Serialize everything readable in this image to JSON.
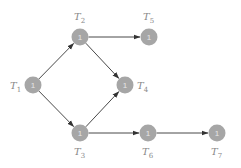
{
  "diagram": {
    "type": "task-dependency-graph",
    "colors": {
      "node_fill": "#a6a6a6",
      "node_text": "#e6e6e6",
      "edge": "#333333",
      "label": "#888888"
    },
    "nodes": [
      {
        "id": "T1",
        "name": "T",
        "sub": "1",
        "value": "1",
        "cx": 33,
        "cy": 85,
        "lx": 10,
        "ly": 89
      },
      {
        "id": "T2",
        "name": "T",
        "sub": "2",
        "value": "1",
        "cx": 80,
        "cy": 37,
        "lx": 74,
        "ly": 20
      },
      {
        "id": "T3",
        "name": "T",
        "sub": "3",
        "value": "1",
        "cx": 80,
        "cy": 133,
        "lx": 74,
        "ly": 155
      },
      {
        "id": "T4",
        "name": "T",
        "sub": "4",
        "value": "1",
        "cx": 125,
        "cy": 85,
        "lx": 137,
        "ly": 89
      },
      {
        "id": "T5",
        "name": "T",
        "sub": "5",
        "value": "1",
        "cx": 149,
        "cy": 37,
        "lx": 143,
        "ly": 20
      },
      {
        "id": "T6",
        "name": "T",
        "sub": "6",
        "value": "1",
        "cx": 148,
        "cy": 133,
        "lx": 142,
        "ly": 155
      },
      {
        "id": "T7",
        "name": "T",
        "sub": "7",
        "value": "1",
        "cx": 217,
        "cy": 133,
        "lx": 211,
        "ly": 155
      }
    ],
    "edges": [
      {
        "from": "T1",
        "to": "T2"
      },
      {
        "from": "T1",
        "to": "T3"
      },
      {
        "from": "T2",
        "to": "T5"
      },
      {
        "from": "T2",
        "to": "T4"
      },
      {
        "from": "T3",
        "to": "T4"
      },
      {
        "from": "T3",
        "to": "T6"
      },
      {
        "from": "T6",
        "to": "T7"
      }
    ]
  }
}
